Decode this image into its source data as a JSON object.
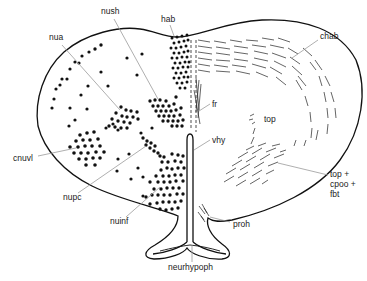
{
  "figure": {
    "type": "brain-section-diagram",
    "colors": {
      "ink": "#111111",
      "leader": "#9a9a9a",
      "background": "#ffffff"
    },
    "labels": [
      {
        "id": "nush",
        "text": "nush",
        "x": 101,
        "y": 13,
        "target": [
          154,
          99
        ]
      },
      {
        "id": "hab",
        "text": "hab",
        "x": 161,
        "y": 21,
        "target": [
          174,
          36
        ]
      },
      {
        "id": "nua",
        "text": "nua",
        "x": 49,
        "y": 39,
        "target": [
          120,
          110
        ]
      },
      {
        "id": "chab",
        "text": "chab",
        "x": 320,
        "y": 38,
        "target": [
          292,
          58
        ]
      },
      {
        "id": "fr",
        "text": "fr",
        "x": 212,
        "y": 106,
        "target": [
          199,
          111
        ]
      },
      {
        "id": "top",
        "text": "top",
        "x": 264,
        "y": 121,
        "target": null
      },
      {
        "id": "vhy",
        "text": "vhy",
        "x": 212,
        "y": 142,
        "target": [
          194,
          152
        ]
      },
      {
        "id": "cnuvl",
        "text": "cnuvl",
        "x": 13,
        "y": 160,
        "target": [
          70,
          148
        ]
      },
      {
        "id": "top-cpoo-fbt",
        "text": [
          "top +",
          "cpoo +",
          "fbt"
        ],
        "x": 330,
        "y": 178,
        "target": [
          278,
          163
        ]
      },
      {
        "id": "nupc",
        "text": "nupc",
        "x": 63,
        "y": 199,
        "target": [
          148,
          145
        ]
      },
      {
        "id": "nuinf",
        "text": "nuinf",
        "x": 110,
        "y": 223,
        "target": [
          160,
          186
        ]
      },
      {
        "id": "proh",
        "text": "proh",
        "x": 233,
        "y": 226,
        "target": [
          212,
          216
        ]
      },
      {
        "id": "neurhypoph",
        "text": "neurhypoph",
        "x": 168,
        "y": 268,
        "target": [
          192,
          244
        ]
      }
    ]
  }
}
